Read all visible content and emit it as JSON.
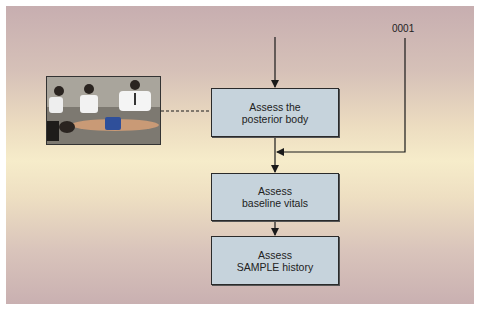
{
  "diagram": {
    "type": "flowchart",
    "reference_label": "0001",
    "boxes": [
      {
        "line1": "Assess the",
        "line2": "posterior body"
      },
      {
        "line1": "Assess",
        "line2": "baseline vitals"
      },
      {
        "line1": "Assess",
        "line2": "SAMPLE history"
      }
    ],
    "photo": {
      "description": "Rescuers assessing the posterior body of a prone patient"
    },
    "colors": {
      "box_fill": "#c6d3dc",
      "box_border": "#2a2a2a",
      "background_top": "#c7aeb0",
      "background_middle": "#f6ecca",
      "line": "#1a1a1a"
    }
  }
}
